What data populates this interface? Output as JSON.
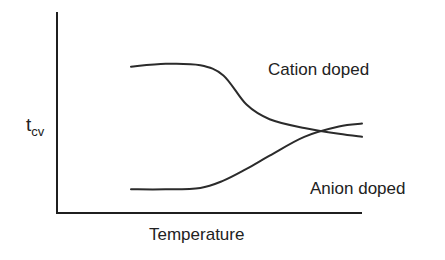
{
  "chart_data": {
    "type": "line",
    "title": "",
    "xlabel": "Temperature",
    "ylabel": "t",
    "ylabel_subscript": "cv",
    "x_ticks": [],
    "y_ticks": [],
    "grid": false,
    "xlim": [
      0,
      100
    ],
    "ylim": [
      0,
      100
    ],
    "series": [
      {
        "name": "Cation doped",
        "x": [
          0,
          15,
          30,
          40,
          50,
          60,
          75,
          90,
          100
        ],
        "y": [
          92,
          94,
          93,
          86,
          66,
          56,
          50,
          46,
          44
        ]
      },
      {
        "name": "Anion doped",
        "x": [
          0,
          15,
          30,
          40,
          50,
          60,
          75,
          90,
          100
        ],
        "y": [
          8,
          8,
          9,
          14,
          22,
          31,
          44,
          51,
          53
        ]
      }
    ],
    "annotations": [
      {
        "text": "Cation doped",
        "target": "Cation doped"
      },
      {
        "text": "Anion doped",
        "target": "Anion doped"
      }
    ],
    "colors": {
      "line": "#2b2b2b",
      "axis": "#1f1f1f",
      "text": "#222222"
    }
  }
}
